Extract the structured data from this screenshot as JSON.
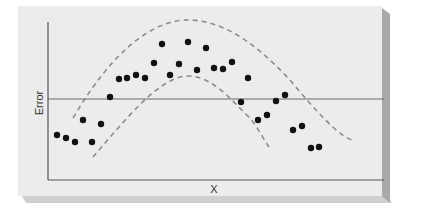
{
  "chart_data": {
    "type": "scatter",
    "title": "",
    "xlabel": "X",
    "ylabel": "Error",
    "grid": false,
    "legend": null,
    "reference_line": {
      "y": 0,
      "label": ""
    },
    "confidence_band": {
      "style": "dashed",
      "shape": "inverted-parabola",
      "upper_peak_px": [
        190,
        20
      ],
      "lower_peak_px": [
        188,
        76
      ]
    },
    "points_px": [
      [
        57,
        135
      ],
      [
        66,
        138
      ],
      [
        75,
        142
      ],
      [
        83,
        120
      ],
      [
        92,
        142
      ],
      [
        101,
        124
      ],
      [
        110,
        97
      ],
      [
        119,
        79
      ],
      [
        127,
        78
      ],
      [
        136,
        75
      ],
      [
        145,
        78
      ],
      [
        154,
        63
      ],
      [
        162,
        44
      ],
      [
        170,
        75
      ],
      [
        179,
        64
      ],
      [
        188,
        42
      ],
      [
        197,
        70
      ],
      [
        206,
        48
      ],
      [
        214,
        68
      ],
      [
        223,
        69
      ],
      [
        232,
        62
      ],
      [
        241,
        102
      ],
      [
        248,
        78
      ],
      [
        258,
        120
      ],
      [
        267,
        115
      ],
      [
        276,
        101
      ],
      [
        285,
        95
      ],
      [
        293,
        130
      ],
      [
        302,
        126
      ],
      [
        311,
        148
      ],
      [
        319,
        147
      ]
    ]
  },
  "figure": {
    "x_axis_label": "X",
    "y_axis_label": "Error",
    "colors": {
      "panel": "#ececec",
      "panel_shadow": "#a9a9a9",
      "axis": "#555555",
      "zero_line": "#6a6a6a",
      "dashed_band": "#8c8c8c",
      "points": "#111111"
    }
  }
}
